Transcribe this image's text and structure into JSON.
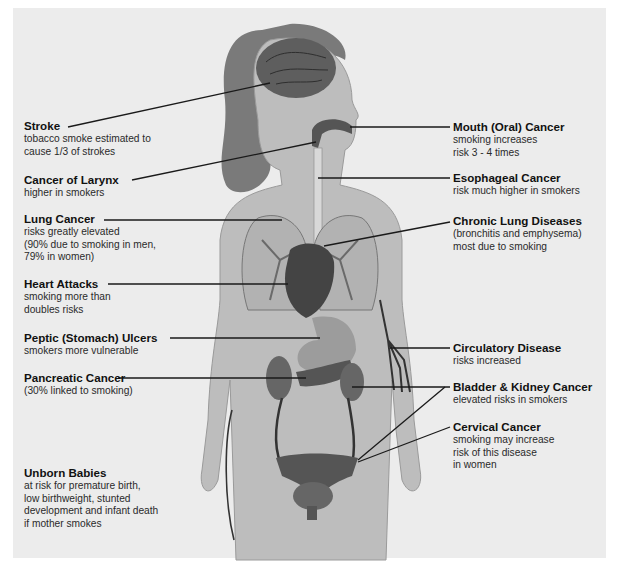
{
  "figure": {
    "left_labels": [
      {
        "title": "Stroke",
        "desc": "tobacco smoke estimated to\ncause 1/3 of strokes"
      },
      {
        "title": "Cancer of Larynx",
        "desc": "higher in smokers"
      },
      {
        "title": "Lung Cancer",
        "desc": "risks greatly elevated\n(90% due to smoking in men,\n79% in women)"
      },
      {
        "title": "Heart Attacks",
        "desc": "smoking more than\ndoubles risks"
      },
      {
        "title": "Peptic (Stomach) Ulcers",
        "desc": "smokers more vulnerable"
      },
      {
        "title": "Pancreatic Cancer",
        "desc": "(30% linked to smoking)"
      },
      {
        "title": "Unborn Babies",
        "desc": "at risk for premature birth,\nlow birthweight, stunted\ndevelopment and infant death\nif mother smokes"
      }
    ],
    "right_labels": [
      {
        "title": "Mouth (Oral) Cancer",
        "desc": "smoking increases\nrisk 3 - 4 times"
      },
      {
        "title": "Esophageal Cancer",
        "desc": "risk much higher in smokers"
      },
      {
        "title": "Chronic Lung Diseases",
        "desc": "(bronchitis and emphysema)\nmost due to smoking"
      },
      {
        "title": "Circulatory Disease",
        "desc": "risks increased"
      },
      {
        "title": "Bladder & Kidney Cancer",
        "desc": "elevated risks in smokers"
      },
      {
        "title": "Cervical Cancer",
        "desc": "smoking may increase\nrisk of this disease\nin women"
      }
    ],
    "colors": {
      "background": "#ececec",
      "body": "#bdbdbd",
      "hair": "#6e6e6e",
      "organs": "#555555",
      "leader_line": "#1a1a1a"
    }
  }
}
